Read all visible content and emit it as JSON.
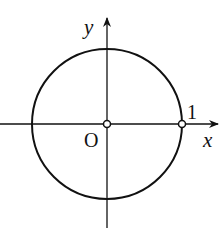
{
  "diagram": {
    "type": "unit-circle",
    "axes": {
      "x_label": "x",
      "y_label": "y"
    },
    "origin_label": "O",
    "point_label": "1",
    "circle": {
      "center": [
        0,
        0
      ],
      "radius": 1
    },
    "open_points": [
      "O (0,0)",
      "(1,0)"
    ],
    "colors": {
      "stroke": "#111111",
      "background": "#ffffff"
    }
  }
}
